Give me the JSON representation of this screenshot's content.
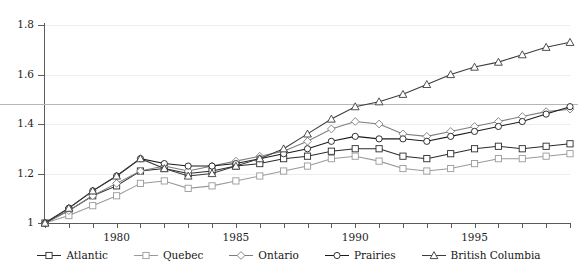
{
  "title_clipped": "",
  "chart_data": {
    "type": "line",
    "title": "",
    "xlabel": "",
    "ylabel": "",
    "xlim": [
      1977,
      1999
    ],
    "ylim": [
      1.0,
      1.8
    ],
    "yticks": [
      "1",
      "1.2",
      "1.4",
      "1.6",
      "1.8"
    ],
    "ytick_values": [
      1.0,
      1.2,
      1.4,
      1.6,
      1.8
    ],
    "xticks": [
      "1980",
      "1985",
      "1990",
      "1995"
    ],
    "xtick_values": [
      1980,
      1985,
      1990,
      1995
    ],
    "grid": true,
    "legend_position": "bottom",
    "reference_line": 1.48,
    "x": [
      1977,
      1978,
      1979,
      1980,
      1981,
      1982,
      1983,
      1984,
      1985,
      1986,
      1987,
      1988,
      1989,
      1990,
      1991,
      1992,
      1993,
      1994,
      1995,
      1996,
      1997,
      1998,
      1999
    ],
    "series": [
      {
        "name": "Atlantic",
        "marker": "square",
        "color": "#2b2b2b",
        "values": [
          1.0,
          1.05,
          1.11,
          1.15,
          1.21,
          1.22,
          1.2,
          1.21,
          1.23,
          1.24,
          1.26,
          1.27,
          1.29,
          1.3,
          1.3,
          1.27,
          1.26,
          1.28,
          1.3,
          1.31,
          1.3,
          1.31,
          1.32
        ]
      },
      {
        "name": "Quebec",
        "marker": "square",
        "color": "#9a9a9a",
        "values": [
          1.0,
          1.03,
          1.07,
          1.11,
          1.16,
          1.17,
          1.14,
          1.15,
          1.17,
          1.19,
          1.21,
          1.23,
          1.26,
          1.27,
          1.25,
          1.22,
          1.21,
          1.22,
          1.24,
          1.26,
          1.26,
          1.27,
          1.28
        ]
      },
      {
        "name": "Ontario",
        "marker": "diamond",
        "color": "#7d7d7d",
        "values": [
          1.0,
          1.05,
          1.11,
          1.16,
          1.21,
          1.23,
          1.21,
          1.23,
          1.25,
          1.27,
          1.29,
          1.33,
          1.38,
          1.41,
          1.4,
          1.36,
          1.35,
          1.37,
          1.39,
          1.41,
          1.43,
          1.45,
          1.46
        ]
      },
      {
        "name": "Prairies",
        "marker": "circle",
        "color": "#1b1b1b",
        "values": [
          1.0,
          1.06,
          1.13,
          1.19,
          1.26,
          1.24,
          1.23,
          1.23,
          1.24,
          1.26,
          1.28,
          1.3,
          1.33,
          1.35,
          1.34,
          1.34,
          1.33,
          1.35,
          1.37,
          1.39,
          1.41,
          1.44,
          1.47
        ]
      },
      {
        "name": "British Columbia",
        "marker": "triangle",
        "color": "#3c3c3c",
        "values": [
          1.0,
          1.06,
          1.13,
          1.19,
          1.26,
          1.22,
          1.19,
          1.2,
          1.23,
          1.26,
          1.3,
          1.36,
          1.42,
          1.47,
          1.49,
          1.52,
          1.56,
          1.6,
          1.63,
          1.65,
          1.68,
          1.71,
          1.73
        ]
      }
    ]
  },
  "legend": {
    "items": [
      {
        "label": "Atlantic",
        "marker": "square",
        "color": "#2b2b2b"
      },
      {
        "label": "Quebec",
        "marker": "square",
        "color": "#9a9a9a"
      },
      {
        "label": "Ontario",
        "marker": "diamond",
        "color": "#7d7d7d"
      },
      {
        "label": "Prairies",
        "marker": "circle",
        "color": "#1b1b1b"
      },
      {
        "label": "British Columbia",
        "marker": "triangle",
        "color": "#3c3c3c"
      }
    ]
  }
}
